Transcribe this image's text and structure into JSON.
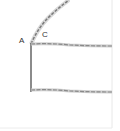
{
  "diagram": {
    "labels": {
      "a": "A",
      "c": "C"
    },
    "colors": {
      "rope": "#9a9a9a",
      "rope_dark": "#6e6e6e",
      "border": "#e6e6e6",
      "background": "#ffffff"
    }
  }
}
